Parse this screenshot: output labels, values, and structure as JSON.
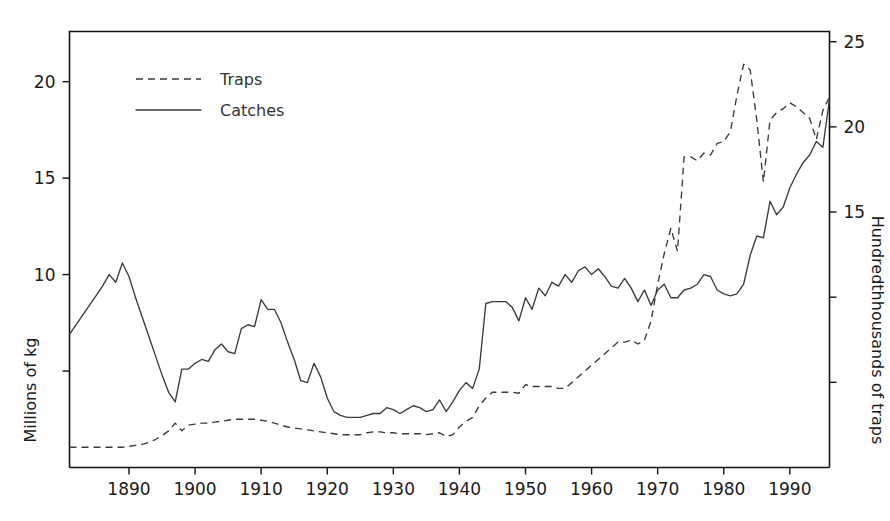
{
  "chart_data": {
    "type": "line",
    "title": "",
    "xlabel": "",
    "ylabel": "Millions of kg",
    "y2label": "Hundredthhousands of traps",
    "xlim": [
      1881,
      1996
    ],
    "ylim": [
      0,
      22.6
    ],
    "y2lim": [
      0,
      25.6
    ],
    "xticks": [
      1890,
      1900,
      1910,
      1920,
      1930,
      1940,
      1950,
      1960,
      1970,
      1980,
      1990
    ],
    "xticklabels": [
      "1890",
      "1900",
      "1910",
      "1920",
      "1930",
      "1940",
      "1950",
      "1960",
      "1970",
      "1980",
      "1990"
    ],
    "yticks": [
      5,
      10,
      15,
      20
    ],
    "yticklabels": [
      "5",
      "10",
      "15",
      "20"
    ],
    "yticklabels_shown": [
      "10",
      "15",
      "20"
    ],
    "y2ticks": [
      5,
      10,
      15,
      20,
      25
    ],
    "y2ticklabels": [
      "5",
      "10",
      "15",
      "20",
      "25"
    ],
    "y2ticklabels_shown": [
      "15",
      "20",
      "25"
    ],
    "grid": false,
    "legend_position": "upper-left-inside",
    "legend": [
      "Traps",
      "Catches"
    ],
    "line_color": "#3a3a3a",
    "x": [
      1881,
      1882,
      1883,
      1884,
      1885,
      1886,
      1887,
      1888,
      1889,
      1890,
      1891,
      1892,
      1893,
      1894,
      1895,
      1896,
      1897,
      1898,
      1899,
      1900,
      1901,
      1902,
      1903,
      1904,
      1905,
      1906,
      1907,
      1908,
      1909,
      1910,
      1911,
      1912,
      1913,
      1914,
      1915,
      1916,
      1917,
      1918,
      1919,
      1920,
      1921,
      1922,
      1923,
      1924,
      1925,
      1926,
      1927,
      1928,
      1929,
      1930,
      1931,
      1932,
      1933,
      1934,
      1935,
      1936,
      1937,
      1938,
      1939,
      1940,
      1941,
      1942,
      1943,
      1944,
      1945,
      1946,
      1947,
      1948,
      1949,
      1950,
      1951,
      1952,
      1953,
      1954,
      1955,
      1956,
      1957,
      1958,
      1959,
      1960,
      1961,
      1962,
      1963,
      1964,
      1965,
      1966,
      1967,
      1968,
      1969,
      1970,
      1971,
      1972,
      1973,
      1974,
      1975,
      1976,
      1977,
      1978,
      1979,
      1980,
      1981,
      1982,
      1983,
      1984,
      1985,
      1986,
      1987,
      1988,
      1989,
      1990,
      1991,
      1992,
      1993,
      1994,
      1995,
      1996
    ],
    "series": [
      {
        "name": "Catches",
        "axis": "left",
        "units": "Millions of kg",
        "style": "solid",
        "values": [
          6.9,
          7.4,
          7.9,
          8.4,
          8.9,
          9.4,
          10.0,
          9.6,
          10.6,
          9.9,
          8.8,
          7.8,
          6.8,
          5.8,
          4.8,
          3.9,
          3.4,
          5.1,
          5.1,
          5.4,
          5.6,
          5.5,
          6.1,
          6.4,
          6.0,
          5.9,
          7.2,
          7.4,
          7.3,
          8.7,
          8.2,
          8.2,
          7.5,
          6.5,
          5.6,
          4.5,
          4.4,
          5.4,
          4.7,
          3.6,
          2.9,
          2.7,
          2.6,
          2.6,
          2.6,
          2.7,
          2.8,
          2.8,
          3.1,
          3.0,
          2.8,
          3.0,
          3.2,
          3.1,
          2.9,
          3.0,
          3.5,
          2.9,
          3.4,
          4.0,
          4.4,
          4.1,
          5.1,
          8.5,
          8.6,
          8.6,
          8.6,
          8.3,
          7.6,
          8.8,
          8.2,
          9.3,
          8.9,
          9.6,
          9.4,
          10.0,
          9.6,
          10.2,
          10.4,
          10.0,
          10.3,
          9.9,
          9.4,
          9.3,
          9.8,
          9.3,
          8.6,
          9.2,
          8.4,
          9.2,
          9.5,
          8.8,
          8.8,
          9.2,
          9.3,
          9.5,
          10.0,
          9.9,
          9.2,
          9.0,
          8.9,
          9.0,
          9.5,
          11.0,
          12.0,
          11.9,
          13.8,
          13.1,
          13.5,
          14.5,
          15.2,
          15.8,
          16.2,
          16.9,
          16.6,
          19.1
        ]
      },
      {
        "name": "Traps",
        "axis": "right",
        "units": "Hundredthhousands of traps",
        "style": "dashed",
        "values_left_scale": [
          1.05,
          1.05,
          1.05,
          1.05,
          1.05,
          1.05,
          1.05,
          1.05,
          1.05,
          1.1,
          1.15,
          1.2,
          1.3,
          1.45,
          1.65,
          1.9,
          2.3,
          1.9,
          2.2,
          2.25,
          2.3,
          2.3,
          2.35,
          2.4,
          2.45,
          2.5,
          2.5,
          2.5,
          2.5,
          2.45,
          2.4,
          2.3,
          2.2,
          2.1,
          2.05,
          2.0,
          1.95,
          1.9,
          1.85,
          1.8,
          1.75,
          1.7,
          1.7,
          1.7,
          1.7,
          1.8,
          1.85,
          1.85,
          1.8,
          1.8,
          1.75,
          1.75,
          1.75,
          1.75,
          1.7,
          1.75,
          1.8,
          1.6,
          1.7,
          2.1,
          2.4,
          2.6,
          3.2,
          3.6,
          3.9,
          3.9,
          3.9,
          3.9,
          3.85,
          4.3,
          4.2,
          4.2,
          4.2,
          4.2,
          4.1,
          4.1,
          4.4,
          4.7,
          5.0,
          5.3,
          5.6,
          5.9,
          6.2,
          6.5,
          6.5,
          6.6,
          6.4,
          6.6,
          7.6,
          9.5,
          11.1,
          12.4,
          11.2,
          16.1,
          16.1,
          15.9,
          16.3,
          16.2,
          16.8,
          16.9,
          17.4,
          19.3,
          20.9,
          20.6,
          18.0,
          14.8,
          18.0,
          18.4,
          18.6,
          18.9,
          18.7,
          18.4,
          18.1,
          17.0,
          18.5,
          19.2
        ],
        "values_right_scale": [
          1.2,
          1.2,
          1.2,
          1.2,
          1.2,
          1.2,
          1.2,
          1.2,
          1.2,
          1.25,
          1.3,
          1.35,
          1.5,
          1.65,
          1.9,
          2.2,
          2.6,
          2.2,
          2.5,
          2.55,
          2.6,
          2.6,
          2.65,
          2.7,
          2.8,
          2.85,
          2.85,
          2.85,
          2.85,
          2.8,
          2.7,
          2.6,
          2.5,
          2.4,
          2.3,
          2.3,
          2.2,
          2.15,
          2.1,
          2.05,
          2.0,
          1.95,
          1.95,
          1.95,
          1.95,
          2.05,
          2.1,
          2.1,
          2.05,
          2.05,
          2.0,
          2.0,
          2.0,
          2.0,
          1.95,
          2.0,
          2.05,
          1.8,
          1.95,
          2.4,
          2.7,
          2.95,
          3.6,
          4.1,
          4.4,
          4.4,
          4.4,
          4.4,
          4.35,
          4.9,
          4.8,
          4.8,
          4.8,
          4.8,
          4.65,
          4.65,
          5.0,
          5.35,
          5.7,
          6.0,
          6.35,
          6.7,
          7.05,
          7.4,
          7.4,
          7.5,
          7.3,
          7.5,
          8.6,
          10.8,
          12.6,
          14.1,
          12.7,
          18.3,
          18.3,
          18.1,
          18.5,
          18.4,
          19.1,
          19.2,
          19.8,
          21.9,
          23.7,
          23.4,
          20.4,
          16.8,
          20.4,
          20.9,
          21.1,
          21.5,
          21.2,
          20.9,
          20.6,
          19.3,
          21.0,
          21.8
        ]
      }
    ]
  }
}
